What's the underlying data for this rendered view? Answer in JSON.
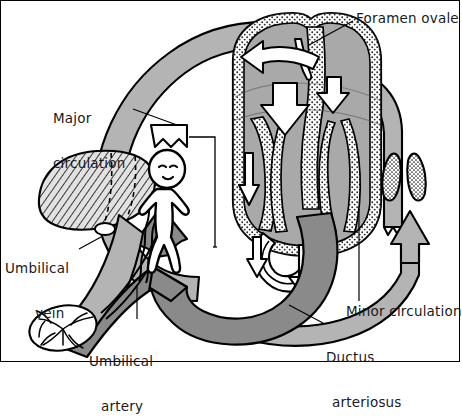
{
  "figure": {
    "type": "anatomical-schematic",
    "background_color": "#ffffff",
    "line_color": "#000000",
    "colors": {
      "oxygenated_vessel": "#b4b4b4",
      "deoxygenated_vessel": "#8a8a8a",
      "heart_chamber": "#a9a9a9",
      "myocardium_stipple": "#d9d9d9",
      "liver_hatch": "#c9c9c9",
      "lung_stipple": "#cfcfcf",
      "flow_arrow_fill": "#ffffff",
      "text": "#1a1a1a"
    }
  },
  "labels": [
    {
      "id": "foramen-ovale",
      "text": "Foramen ovale",
      "lines": [
        "Foramen ovale"
      ],
      "x": 355,
      "y": 10,
      "leader_to": "interatrial-septum"
    },
    {
      "id": "major-circulation",
      "text": "Major circulation",
      "lines": [
        "Major",
        "circulation"
      ],
      "x": 52,
      "y": 80,
      "leader_to": "aortic-arch"
    },
    {
      "id": "umbilical-vein",
      "text": "Umbilical vein",
      "lines": [
        "Umbilical",
        "vein"
      ],
      "x": 4,
      "y": 230,
      "leader_to": "umbilical-vein-vessel"
    },
    {
      "id": "umbilical-artery",
      "text": "Umbilical artery",
      "lines": [
        "Umbilical",
        "artery"
      ],
      "x": 88,
      "y": 323,
      "leader_to": "umbilical-artery-vessel"
    },
    {
      "id": "minor-circulation",
      "text": "Minor circulation",
      "lines": [
        "Minor circulation"
      ],
      "x": 345,
      "y": 303,
      "leader_to": "pulmonary-trunk"
    },
    {
      "id": "ductus-arteriosus",
      "text": "Ductus arteriosus",
      "lines": [
        "Ductus",
        "arteriosus"
      ],
      "x": 325,
      "y": 319,
      "leader_to": "ductus-arteriosus-vessel"
    }
  ],
  "structures": [
    {
      "id": "heart",
      "name": "heart",
      "description": "Cross-sectioned fetal heart with four chambers and stippled myocardium"
    },
    {
      "id": "lungs",
      "name": "lungs",
      "description": "Pair of small stippled collapsed fetal lungs"
    },
    {
      "id": "liver",
      "name": "liver",
      "description": "Hatched liver with dashed internal outlines"
    },
    {
      "id": "fetus",
      "name": "fetus",
      "description": "Outline figure of fetus with umbilical cord"
    },
    {
      "id": "placenta",
      "name": "placenta",
      "description": "Oval placenta with branching vessels"
    },
    {
      "id": "aortic-arch",
      "name": "aortic arch",
      "description": "Light grey arch of the major circulation"
    },
    {
      "id": "ductus-arteriosus-vessel",
      "name": "ductus arteriosus",
      "description": "Shunt between pulmonary trunk and aorta"
    },
    {
      "id": "foramen-ovale-opening",
      "name": "foramen ovale",
      "description": "Opening in the interatrial septum"
    }
  ],
  "flow_arrows": [
    {
      "id": "arrow-foramen-ovale",
      "direction": "right-to-left through septum",
      "style": "white outlined"
    },
    {
      "id": "arrow-right-atrium-down",
      "direction": "down",
      "style": "white outlined"
    },
    {
      "id": "arrow-right-ventricle-down",
      "direction": "down",
      "style": "white outlined"
    },
    {
      "id": "arrow-left-ventricle-down",
      "direction": "down-left",
      "style": "white outlined"
    },
    {
      "id": "arrow-ductus",
      "direction": "down",
      "style": "white outlined"
    },
    {
      "id": "arrow-pulmonary-up",
      "direction": "up",
      "style": "white outlined"
    },
    {
      "id": "arrow-descending-aorta",
      "direction": "down toward fetus",
      "style": "grey solid"
    },
    {
      "id": "arrow-umbilical-artery",
      "direction": "toward placenta",
      "style": "dark grey solid"
    },
    {
      "id": "arrow-umbilical-vein",
      "direction": "toward liver",
      "style": "light grey solid"
    }
  ]
}
